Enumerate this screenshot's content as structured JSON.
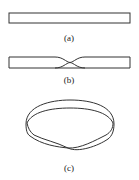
{
  "figure": {
    "panels": [
      {
        "id": "a",
        "label": "(a)",
        "description": "flat rectangular strip"
      },
      {
        "id": "b",
        "label": "(b)",
        "description": "strip with a half twist"
      },
      {
        "id": "c",
        "label": "(c)",
        "description": "Möbius band formed by joining ends"
      }
    ],
    "stroke_color": "#333333",
    "background": "#ffffff"
  }
}
